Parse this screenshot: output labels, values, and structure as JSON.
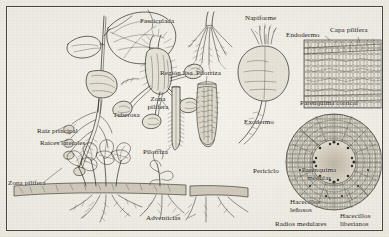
{
  "figure": {
    "language": "es",
    "medium": "pen-and-ink botanical plate",
    "paper_color": "#efece4",
    "ink_color": "#24211c"
  },
  "labels": {
    "fasciculada": "Fasciculada",
    "napiforme": "Napiforme",
    "endodermo": "Endodermo",
    "capa_pilifera": "Capa pilífera",
    "region_lisa": "Región lisa",
    "pilorriza_top": "Pilorriza",
    "zona_pilifera_mid": "Zona pilífera",
    "tuberosa": "Tuberosa",
    "pilorriza_left": "Pilorriza",
    "raiz_principal": "Raíz principal",
    "raices_laterales": "Raíces laterales",
    "zona_pilifera_left": "Zona pilífera",
    "adventicias": "Adventicias",
    "parenquima_cortical": "Parénquima cortical",
    "exodermo": "Exodermo",
    "periciclo": "Periciclo",
    "parenquima_medular": "Parénquima medular",
    "hacecillos_lenosos": "Hacecillos leñosos",
    "radios_medulares": "Radios medulares",
    "hacecillos_liberianos": "Hacecillos liberianos"
  },
  "panels": [
    {
      "name": "seedling-plant",
      "caption_keys": [
        "raiz_principal",
        "raices_laterales",
        "zona_pilifera_left"
      ]
    },
    {
      "name": "tuberous-root",
      "caption_keys": [
        "tuberosa"
      ]
    },
    {
      "name": "fasciculate-root",
      "caption_keys": [
        "fasciculada",
        "region_lisa"
      ]
    },
    {
      "name": "root-tip-smooth",
      "caption_keys": [
        "zona_pilifera_mid",
        "pilorriza_left"
      ]
    },
    {
      "name": "root-tip-hairy",
      "caption_keys": [
        "pilorriza_top"
      ]
    },
    {
      "name": "napiform-root",
      "caption_keys": [
        "napiforme"
      ]
    },
    {
      "name": "adventitious-roots",
      "caption_keys": [
        "adventicias"
      ]
    },
    {
      "name": "cortex-cells-detail",
      "caption_keys": [
        "endodermo",
        "capa_pilifera",
        "parenquima_cortical"
      ]
    },
    {
      "name": "root-cross-section",
      "caption_keys": [
        "exodermo",
        "periciclo",
        "parenquima_medular",
        "hacecillos_lenosos",
        "radios_medulares",
        "hacecillos_liberianos"
      ]
    }
  ]
}
